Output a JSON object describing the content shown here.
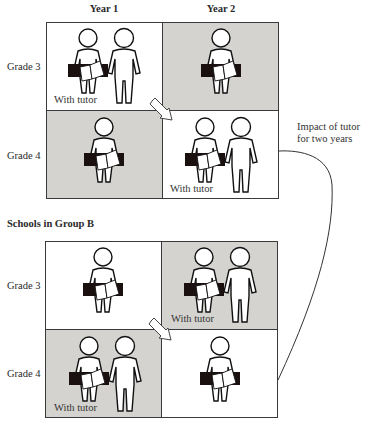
{
  "columns": [
    "Year 1",
    "Year 2"
  ],
  "rows": [
    "Grade 3",
    "Grade 4"
  ],
  "groups": [
    {
      "title": "",
      "cells": [
        {
          "row": "Grade 3",
          "col": "Year 1",
          "shade": "white",
          "tutor": true,
          "tutor_label": "With tutor"
        },
        {
          "row": "Grade 3",
          "col": "Year 2",
          "shade": "gray",
          "tutor": false,
          "tutor_label": ""
        },
        {
          "row": "Grade 4",
          "col": "Year 1",
          "shade": "gray",
          "tutor": false,
          "tutor_label": ""
        },
        {
          "row": "Grade 4",
          "col": "Year 2",
          "shade": "white",
          "tutor": true,
          "tutor_label": "With tutor"
        }
      ]
    },
    {
      "title": "Schools in Group B",
      "cells": [
        {
          "row": "Grade 3",
          "col": "Year 1",
          "shade": "white",
          "tutor": false,
          "tutor_label": ""
        },
        {
          "row": "Grade 3",
          "col": "Year 2",
          "shade": "gray",
          "tutor": true,
          "tutor_label": "With tutor"
        },
        {
          "row": "Grade 4",
          "col": "Year 1",
          "shade": "gray",
          "tutor": true,
          "tutor_label": "With tutor"
        },
        {
          "row": "Grade 4",
          "col": "Year 2",
          "shade": "white",
          "tutor": false,
          "tutor_label": ""
        }
      ]
    }
  ],
  "annotation": {
    "line1": "Impact of tutor",
    "line2": "for two years"
  },
  "icons": {
    "student": "student-with-book-icon",
    "tutor": "tutor-figure-icon",
    "arrow": "diagonal-arrow-icon"
  },
  "colors": {
    "gray_cell": "#d4d3d0",
    "white_cell": "#ffffff",
    "border": "#3a3a3a",
    "book_band": "#1a1010"
  }
}
